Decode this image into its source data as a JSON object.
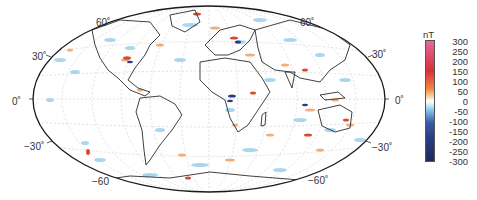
{
  "figure": {
    "projection": "Hammer-Aitoff (global, Atlantic-centred)",
    "colorbar": {
      "unit": "nT",
      "ticks": [
        "300",
        "250",
        "200",
        "150",
        "100",
        "50",
        "0",
        "-50",
        "-100",
        "-150",
        "-200",
        "-250",
        "-300"
      ],
      "range": [
        -300,
        300
      ],
      "colors": {
        "max": "#e5679a",
        "high": "#d7303b",
        "mid_high": "#f08a3c",
        "zero": "#ffffff",
        "mid_low": "#7cc4e8",
        "low": "#2c3e86",
        "min": "#1f2a5c"
      }
    },
    "lat_labels_left": [
      {
        "text": "60˚",
        "lat": 60
      },
      {
        "text": "30˚",
        "lat": 30
      },
      {
        "text": "0˚",
        "lat": 0
      },
      {
        "text": "−30˚",
        "lat": -30
      },
      {
        "text": "−60",
        "lat": -60
      }
    ],
    "lat_labels_right": [
      {
        "text": "60˚",
        "lat": 60
      },
      {
        "text": "30˚",
        "lat": 30
      },
      {
        "text": "0˚",
        "lat": 0
      },
      {
        "text": "−30˚",
        "lat": -30
      },
      {
        "text": "−60˚",
        "lat": -60
      }
    ],
    "colors": {
      "outline": "#1a1a1a",
      "coast": "#2a2a2a",
      "grid": "#c8c8c8",
      "positive": "#e8602c",
      "negative": "#3a8fd0",
      "strong_negative": "#2b2f80"
    }
  }
}
